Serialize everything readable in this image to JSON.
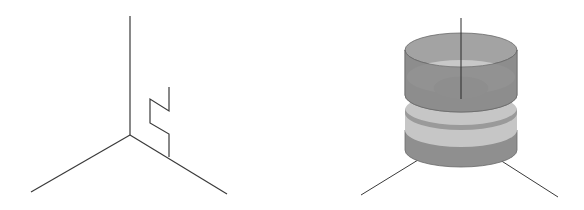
{
  "figure": {
    "panels": [
      {
        "id": "left",
        "description": "3D axes with zigzag path rising from right axis",
        "axes": {
          "origin": [
            130,
            135
          ],
          "vertical_top": [
            130,
            16
          ],
          "left_end": [
            31,
            192
          ],
          "right_end": [
            227,
            194
          ]
        },
        "path_points": "169,157 169,134 150,123 150,99 169,111 169,87"
      },
      {
        "id": "right",
        "description": "Stacked cylindrical shells (solid of revolution) on 3D axes",
        "cylinder": {
          "cx": 461,
          "rx": 56,
          "ry": 17,
          "top_y": 50,
          "mid_y": 105,
          "bottom_y": 150
        },
        "axes": {
          "vertical_top": [
            461,
            18
          ],
          "vertical_bottom": [
            461,
            99
          ],
          "left_start": [
            418,
            160
          ],
          "left_end": [
            361,
            195
          ],
          "right_start": [
            500,
            160
          ],
          "right_end": [
            558,
            197
          ]
        }
      }
    ],
    "colors": {
      "line": "#3a3a3a",
      "shell_dark": "#8c8c8c",
      "shell_mid": "#a0a0a0",
      "shell_light": "#c8c8c8",
      "inner_core": "#9a9a9a"
    }
  }
}
